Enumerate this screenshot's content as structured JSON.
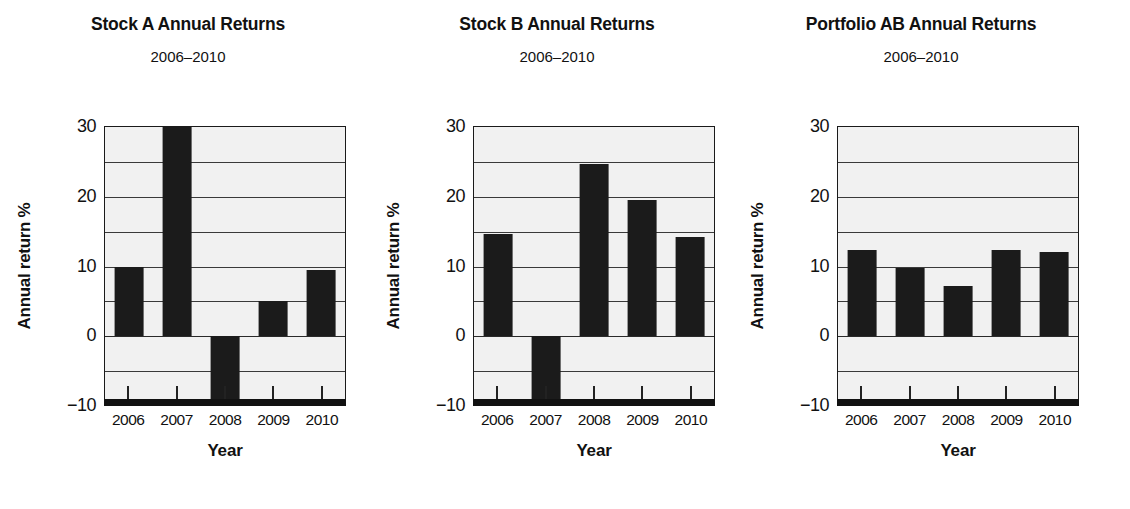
{
  "figure": {
    "axis_label_y": "Annual return %",
    "axis_label_x": "Year",
    "subtitle": "2006–2010",
    "bar_color": "#1b1b1b",
    "plot_background": "#f1f1f1",
    "grid_color": "#3a3a3a",
    "axis_color": "#111111"
  },
  "yticks": [
    {
      "label": "30",
      "value": 30
    },
    {
      "label": "20",
      "value": 20
    },
    {
      "label": "10",
      "value": 10
    },
    {
      "label": "0",
      "value": 0
    },
    {
      "label": "−10",
      "value": -10
    }
  ],
  "gridlines": [
    30,
    25,
    20,
    15,
    10,
    5,
    0,
    -5,
    -10
  ],
  "panels": [
    {
      "title": "Stock A Annual Returns",
      "subtitle": "2006–2010",
      "chart_data": {
        "type": "bar",
        "title": "Stock A Annual Returns",
        "subtitle": "2006–2010",
        "xlabel": "Year",
        "ylabel": "Annual return %",
        "ylim": [
          -10,
          30
        ],
        "ytick_values": [
          -10,
          0,
          10,
          20,
          30
        ],
        "grid": true,
        "legend": "none",
        "categories": [
          "2006",
          "2007",
          "2008",
          "2009",
          "2010"
        ],
        "values": [
          10.0,
          30.0,
          -10.0,
          5.0,
          9.5
        ]
      }
    },
    {
      "title": "Stock B Annual Returns",
      "subtitle": "2006–2010",
      "chart_data": {
        "type": "bar",
        "title": "Stock B Annual Returns",
        "subtitle": "2006–2010",
        "xlabel": "Year",
        "ylabel": "Annual return %",
        "ylim": [
          -10,
          30
        ],
        "ytick_values": [
          -10,
          0,
          10,
          20,
          30
        ],
        "grid": true,
        "legend": "none",
        "categories": [
          "2006",
          "2007",
          "2008",
          "2009",
          "2010"
        ],
        "values": [
          14.7,
          -10.0,
          24.7,
          19.6,
          14.3
        ]
      }
    },
    {
      "title": "Portfolio AB Annual Returns",
      "subtitle": "2006–2010",
      "chart_data": {
        "type": "bar",
        "title": "Portfolio AB Annual Returns",
        "subtitle": "2006–2010",
        "xlabel": "Year",
        "ylabel": "Annual return %",
        "ylim": [
          -10,
          30
        ],
        "ytick_values": [
          -10,
          0,
          10,
          20,
          30
        ],
        "grid": true,
        "legend": "none",
        "categories": [
          "2006",
          "2007",
          "2008",
          "2009",
          "2010"
        ],
        "values": [
          12.3,
          9.8,
          7.2,
          12.3,
          12.1
        ]
      }
    }
  ],
  "chart_data": [
    {
      "type": "bar",
      "title": "Stock A Annual Returns",
      "subtitle": "2006–2010",
      "xlabel": "Year",
      "ylabel": "Annual return %",
      "ylim": [
        -10,
        30
      ],
      "categories": [
        "2006",
        "2007",
        "2008",
        "2009",
        "2010"
      ],
      "values": [
        10.0,
        30.0,
        -10.0,
        5.0,
        9.5
      ]
    },
    {
      "type": "bar",
      "title": "Stock B Annual Returns",
      "subtitle": "2006–2010",
      "xlabel": "Year",
      "ylabel": "Annual return %",
      "ylim": [
        -10,
        30
      ],
      "categories": [
        "2006",
        "2007",
        "2008",
        "2009",
        "2010"
      ],
      "values": [
        14.7,
        -10.0,
        24.7,
        19.6,
        14.3
      ]
    },
    {
      "type": "bar",
      "title": "Portfolio AB Annual Returns",
      "subtitle": "2006–2010",
      "xlabel": "Year",
      "ylabel": "Annual return %",
      "ylim": [
        -10,
        30
      ],
      "categories": [
        "2006",
        "2007",
        "2008",
        "2009",
        "2010"
      ],
      "values": [
        12.3,
        9.8,
        7.2,
        12.3,
        12.1
      ]
    }
  ]
}
